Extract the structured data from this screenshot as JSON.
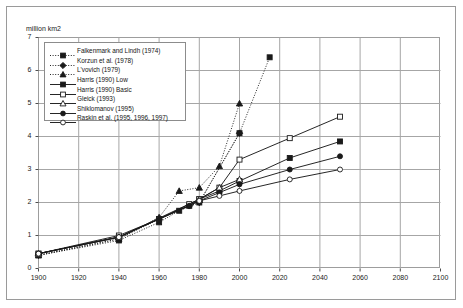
{
  "figure": {
    "unit_label": "million km2"
  },
  "legend": {
    "entries": [
      {
        "label": "Falkenmark and Lindh (1974)",
        "marker": "filled-square",
        "line": "dotted",
        "color": "#1a1a1a"
      },
      {
        "label": "Korzun et al. (1978)",
        "marker": "filled-diamond",
        "line": "dotted",
        "color": "#1a1a1a"
      },
      {
        "label": "L'vovich (1979)",
        "marker": "filled-triangle",
        "line": "dotted",
        "color": "#1a1a1a"
      },
      {
        "label": "Harris (1990) Low",
        "marker": "filled-square",
        "line": "solid",
        "color": "#1a1a1a"
      },
      {
        "label": "Harris (1990) Basic",
        "marker": "open-square",
        "line": "solid",
        "color": "#1a1a1a"
      },
      {
        "label": "Gleick (1993)",
        "marker": "open-triangle",
        "line": "solid",
        "color": "#1a1a1a"
      },
      {
        "label": "Shiklomanov (1995)",
        "marker": "filled-circle",
        "line": "solid",
        "color": "#1a1a1a"
      },
      {
        "label": "Raskin et al. (1995, 1996, 1997)",
        "marker": "open-circle",
        "line": "solid",
        "color": "#1a1a1a"
      }
    ]
  },
  "chart_data": {
    "type": "line",
    "title": "",
    "xlabel": "",
    "ylabel": "million km2",
    "xlim": [
      1900,
      2100
    ],
    "ylim": [
      0,
      7
    ],
    "xticks": [
      1900,
      1920,
      1940,
      1960,
      1980,
      2000,
      2020,
      2040,
      2060,
      2080,
      2100
    ],
    "yticks": [
      0,
      1,
      2,
      3,
      4,
      5,
      6,
      7
    ],
    "grid": true,
    "legend_position": "upper-left-inside",
    "series": [
      {
        "name": "Falkenmark and Lindh (1974)",
        "marker": "filled-square",
        "line": "dotted",
        "x": [
          1900,
          1940,
          1960,
          1970,
          1980,
          2000,
          2015
        ],
        "y": [
          0.4,
          0.85,
          1.4,
          1.75,
          2.0,
          4.1,
          6.4
        ]
      },
      {
        "name": "Korzun et al. (1978)",
        "marker": "filled-diamond",
        "line": "dotted",
        "x": [
          1900,
          1940,
          1960,
          1975,
          1980,
          2000
        ],
        "y": [
          0.4,
          0.9,
          1.5,
          1.9,
          2.0,
          4.1
        ]
      },
      {
        "name": "L'vovich (1979)",
        "marker": "filled-triangle",
        "line": "dotted",
        "x": [
          1900,
          1940,
          1960,
          1970,
          1980,
          1990,
          2000
        ],
        "y": [
          0.4,
          0.9,
          1.55,
          2.35,
          2.45,
          3.1,
          5.0
        ]
      },
      {
        "name": "Harris (1990) Low",
        "marker": "filled-square",
        "line": "solid",
        "x": [
          1900,
          1940,
          1960,
          1975,
          1980,
          1990,
          2000,
          2025,
          2050
        ],
        "y": [
          0.45,
          0.95,
          1.5,
          1.9,
          2.1,
          2.35,
          2.65,
          3.35,
          3.85
        ]
      },
      {
        "name": "Harris (1990) Basic",
        "marker": "open-square",
        "line": "solid",
        "x": [
          1900,
          1940,
          1960,
          1975,
          1980,
          1990,
          2000,
          2025,
          2050
        ],
        "y": [
          0.45,
          1.0,
          1.5,
          1.95,
          2.1,
          2.45,
          3.3,
          3.95,
          4.6
        ]
      },
      {
        "name": "Gleick (1993)",
        "marker": "open-triangle",
        "line": "solid",
        "x": [
          1900,
          1940,
          1980,
          1990,
          2000
        ],
        "y": [
          0.45,
          0.95,
          2.1,
          2.45,
          2.7
        ]
      },
      {
        "name": "Shiklomanov (1995)",
        "marker": "filled-circle",
        "line": "solid",
        "x": [
          1900,
          1940,
          1960,
          1975,
          1980,
          1990,
          2000,
          2025,
          2050
        ],
        "y": [
          0.45,
          0.95,
          1.5,
          1.9,
          2.05,
          2.3,
          2.55,
          3.0,
          3.4
        ]
      },
      {
        "name": "Raskin et al. (1995, 1996, 1997)",
        "marker": "open-circle",
        "line": "solid",
        "x": [
          1900,
          1940,
          1980,
          1990,
          2000,
          2025,
          2050
        ],
        "y": [
          0.45,
          0.95,
          2.05,
          2.2,
          2.35,
          2.7,
          3.0
        ]
      }
    ]
  }
}
